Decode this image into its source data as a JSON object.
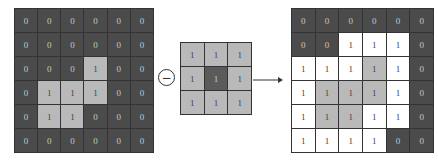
{
  "input_image": {
    "values": [
      [
        0,
        0,
        0,
        0,
        0,
        0
      ],
      [
        0,
        0,
        0,
        0,
        0,
        0
      ],
      [
        0,
        0,
        0,
        1,
        0,
        0
      ],
      [
        0,
        1,
        1,
        1,
        0,
        0
      ],
      [
        0,
        1,
        1,
        0,
        0,
        0
      ],
      [
        0,
        0,
        0,
        0,
        0,
        0
      ]
    ],
    "styles": [
      [
        "d",
        "d",
        "d",
        "d",
        "d",
        "d"
      ],
      [
        "d",
        "d",
        "d",
        "d",
        "d",
        "d"
      ],
      [
        "d",
        "d",
        "d",
        "g",
        "d",
        "d"
      ],
      [
        "d",
        "g",
        "g",
        "g",
        "d",
        "d"
      ],
      [
        "d",
        "g",
        "g",
        "d",
        "d",
        "d"
      ],
      [
        "d",
        "d",
        "d",
        "d",
        "d",
        "d"
      ]
    ]
  },
  "operator": {
    "symbol": "−",
    "name": "minus-circle"
  },
  "kernel": {
    "values": [
      [
        1,
        1,
        1
      ],
      [
        1,
        1,
        1
      ],
      [
        1,
        1,
        1
      ]
    ],
    "styles": [
      [
        "g",
        "g",
        "g"
      ],
      [
        "g",
        "k",
        "g"
      ],
      [
        "g",
        "g",
        "g"
      ]
    ]
  },
  "output_image": {
    "values": [
      [
        0,
        0,
        0,
        0,
        0,
        0
      ],
      [
        0,
        0,
        1,
        1,
        1,
        0
      ],
      [
        1,
        1,
        1,
        1,
        1,
        0
      ],
      [
        1,
        1,
        1,
        1,
        1,
        0
      ],
      [
        1,
        1,
        1,
        1,
        1,
        0
      ],
      [
        1,
        1,
        1,
        1,
        0,
        0
      ]
    ],
    "styles": [
      [
        "d",
        "d",
        "d",
        "d",
        "d",
        "d"
      ],
      [
        "d",
        "d",
        "w",
        "w",
        "w",
        "d"
      ],
      [
        "w",
        "w",
        "w",
        "g",
        "w",
        "d"
      ],
      [
        "w",
        "g",
        "g",
        "g",
        "w",
        "d"
      ],
      [
        "w",
        "g",
        "g",
        "w",
        "w",
        "d"
      ],
      [
        "w",
        "w",
        "w",
        "w",
        "d",
        "d"
      ]
    ]
  },
  "colors": {
    "dark": "#4b4b4b",
    "gray": "#b9b9b9",
    "white": "#ffffff",
    "kernel_center": "#5a5a5a"
  }
}
